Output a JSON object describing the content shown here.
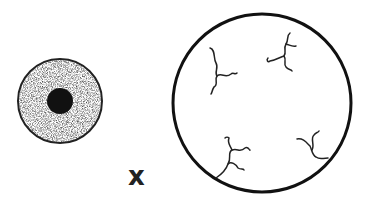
{
  "diagram": {
    "operator_symbol": "x",
    "small_cell": {
      "description": "stippled cell with dark nucleus",
      "cx": 60,
      "cy": 101,
      "r": 42,
      "nucleus_r": 13,
      "fill": "#9a9a9a",
      "nucleus_fill": "#111111"
    },
    "large_cell": {
      "description": "large circle with four branching filaments",
      "cx": 262,
      "cy": 103,
      "r": 90,
      "stroke": "#111111",
      "filament_count": 4
    }
  }
}
